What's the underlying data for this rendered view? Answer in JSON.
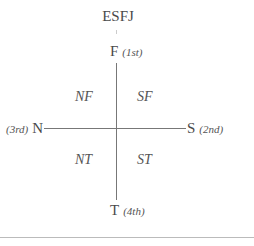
{
  "diagram": {
    "type_label": "ESFJ",
    "poles": {
      "top": {
        "letter": "F",
        "order": "(1st)"
      },
      "right": {
        "letter": "S",
        "order": "(2nd)"
      },
      "left": {
        "letter": "N",
        "order": "(3rd)"
      },
      "bottom": {
        "letter": "T",
        "order": "(4th)"
      }
    },
    "quadrants": {
      "top_left": "NF",
      "top_right": "SF",
      "bottom_left": "NT",
      "bottom_right": "ST"
    },
    "colors": {
      "text": "#4a4a4a",
      "axis": "#777777",
      "rule": "#bbbbbb"
    }
  }
}
